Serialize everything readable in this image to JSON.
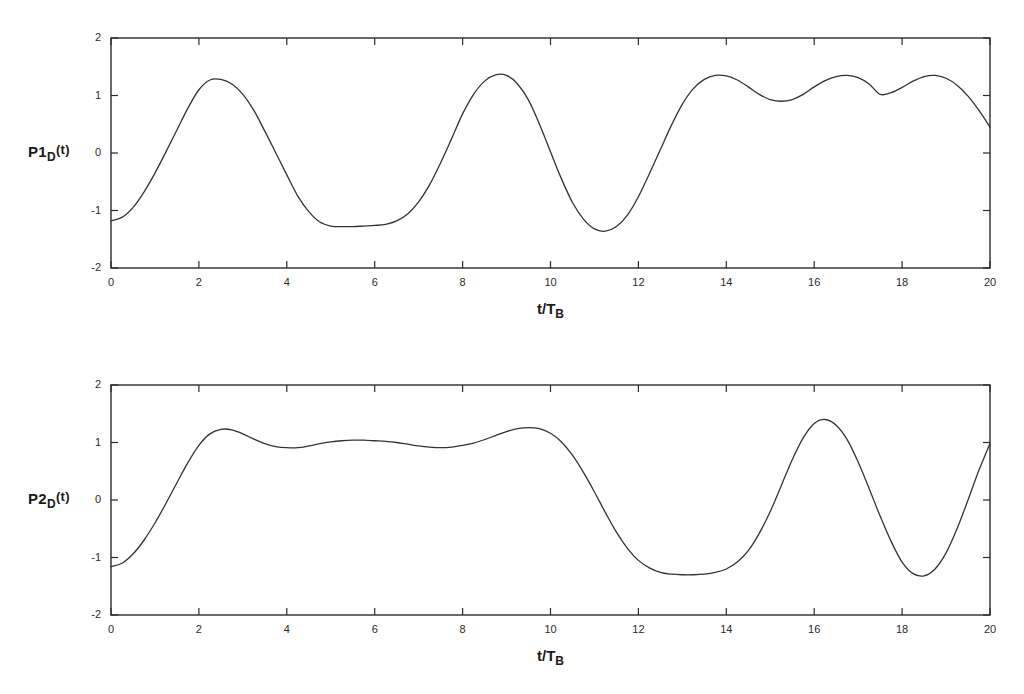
{
  "figure": {
    "background": "#ffffff",
    "line_color": "#333333",
    "axis_color": "#2b2b2b"
  },
  "chart_data": [
    {
      "type": "line",
      "id": "P1D",
      "title": "",
      "ylabel_main": "P1",
      "ylabel_sub": "D",
      "ylabel_suffix": "(t)",
      "xlabel_main": "t/T",
      "xlabel_sub": "B",
      "xlim": [
        0,
        20
      ],
      "ylim": [
        -2,
        2
      ],
      "xticks": [
        0,
        2,
        4,
        6,
        8,
        10,
        12,
        14,
        16,
        18,
        20
      ],
      "xticklabels": [
        "0",
        "2",
        "4",
        "6",
        "8",
        "10",
        "12",
        "14",
        "16",
        "18",
        "20"
      ],
      "yticks": [
        -2,
        -1,
        0,
        1,
        2
      ],
      "yticklabels": [
        "-2",
        "-1",
        "0",
        "1",
        "2"
      ],
      "grid": false,
      "legend": null,
      "x": [
        0.0,
        0.25,
        0.5,
        0.75,
        1.0,
        1.25,
        1.5,
        1.75,
        2.0,
        2.25,
        2.5,
        2.75,
        3.0,
        3.25,
        3.5,
        3.75,
        4.0,
        4.25,
        4.5,
        4.75,
        5.0,
        5.25,
        5.5,
        5.75,
        6.0,
        6.25,
        6.5,
        6.75,
        7.0,
        7.25,
        7.5,
        7.75,
        8.0,
        8.25,
        8.5,
        8.75,
        9.0,
        9.25,
        9.5,
        9.75,
        10.0,
        10.25,
        10.5,
        10.75,
        11.0,
        11.25,
        11.5,
        11.75,
        12.0,
        12.25,
        12.5,
        12.75,
        13.0,
        13.25,
        13.5,
        13.75,
        14.0,
        14.25,
        14.5,
        14.75,
        15.0,
        15.25,
        15.5,
        15.75,
        16.0,
        16.25,
        16.5,
        16.75,
        17.0,
        17.25,
        17.5,
        17.75,
        18.0,
        18.25,
        18.5,
        18.75,
        19.0,
        19.25,
        19.5,
        19.75,
        20.0
      ],
      "y": [
        -1.18,
        -1.12,
        -0.95,
        -0.68,
        -0.35,
        0.02,
        0.4,
        0.78,
        1.1,
        1.27,
        1.28,
        1.2,
        1.02,
        0.74,
        0.38,
        0.0,
        -0.38,
        -0.75,
        -1.02,
        -1.2,
        -1.27,
        -1.28,
        -1.28,
        -1.27,
        -1.26,
        -1.24,
        -1.18,
        -1.06,
        -0.85,
        -0.55,
        -0.17,
        0.25,
        0.68,
        1.02,
        1.25,
        1.36,
        1.35,
        1.2,
        0.92,
        0.5,
        0.02,
        -0.45,
        -0.86,
        -1.15,
        -1.32,
        -1.36,
        -1.28,
        -1.08,
        -0.76,
        -0.36,
        0.06,
        0.48,
        0.85,
        1.12,
        1.28,
        1.35,
        1.34,
        1.27,
        1.15,
        1.02,
        0.93,
        0.9,
        0.93,
        1.02,
        1.15,
        1.26,
        1.33,
        1.35,
        1.31,
        1.2,
        1.02,
        1.05,
        1.14,
        1.25,
        1.33,
        1.35,
        1.3,
        1.18,
        0.99,
        0.74,
        0.45
      ],
      "notes": "Oscillatory waveform with peaks near t=2 (1.28), t=8 (1.36), t=12.4 (1.34), t=15.7 (1.34) and troughs near t=4.8 (-1.28), t=10.1 (-1.36), t=18.1 (-1.30); ends rising to about 1.45 at t=20"
    },
    {
      "type": "line",
      "id": "P2D",
      "title": "",
      "ylabel_main": "P2",
      "ylabel_sub": "D",
      "ylabel_suffix": "(t)",
      "xlabel_main": "t/T",
      "xlabel_sub": "B",
      "xlim": [
        0,
        20
      ],
      "ylim": [
        -2,
        2
      ],
      "xticks": [
        0,
        2,
        4,
        6,
        8,
        10,
        12,
        14,
        16,
        18,
        20
      ],
      "xticklabels": [
        "0",
        "2",
        "4",
        "6",
        "8",
        "10",
        "12",
        "14",
        "16",
        "18",
        "20"
      ],
      "yticks": [
        -2,
        -1,
        0,
        1,
        2
      ],
      "yticklabels": [
        "-2",
        "-1",
        "0",
        "1",
        "2"
      ],
      "grid": false,
      "legend": null,
      "x": [
        0.0,
        0.25,
        0.5,
        0.75,
        1.0,
        1.25,
        1.5,
        1.75,
        2.0,
        2.25,
        2.5,
        2.75,
        3.0,
        3.25,
        3.5,
        3.75,
        4.0,
        4.25,
        4.5,
        4.75,
        5.0,
        5.25,
        5.5,
        5.75,
        6.0,
        6.25,
        6.5,
        6.75,
        7.0,
        7.25,
        7.5,
        7.75,
        8.0,
        8.25,
        8.5,
        8.75,
        9.0,
        9.25,
        9.5,
        9.75,
        10.0,
        10.25,
        10.5,
        10.75,
        11.0,
        11.25,
        11.5,
        11.75,
        12.0,
        12.25,
        12.5,
        12.75,
        13.0,
        13.25,
        13.5,
        13.75,
        14.0,
        14.25,
        14.5,
        14.75,
        15.0,
        15.25,
        15.5,
        15.75,
        16.0,
        16.25,
        16.5,
        16.75,
        17.0,
        17.25,
        17.5,
        17.75,
        18.0,
        18.25,
        18.5,
        18.75,
        19.0,
        19.25,
        19.5,
        19.75,
        20.0
      ],
      "y": [
        -1.16,
        -1.1,
        -0.94,
        -0.7,
        -0.4,
        -0.06,
        0.3,
        0.65,
        0.95,
        1.15,
        1.23,
        1.22,
        1.15,
        1.06,
        0.98,
        0.93,
        0.91,
        0.91,
        0.94,
        0.98,
        1.01,
        1.03,
        1.04,
        1.04,
        1.03,
        1.02,
        1.0,
        0.97,
        0.94,
        0.92,
        0.91,
        0.92,
        0.95,
        0.99,
        1.05,
        1.12,
        1.19,
        1.24,
        1.26,
        1.24,
        1.16,
        1.01,
        0.78,
        0.48,
        0.14,
        -0.22,
        -0.56,
        -0.84,
        -1.05,
        -1.18,
        -1.26,
        -1.29,
        -1.3,
        -1.3,
        -1.29,
        -1.26,
        -1.2,
        -1.08,
        -0.88,
        -0.58,
        -0.2,
        0.25,
        0.7,
        1.08,
        1.33,
        1.4,
        1.3,
        1.05,
        0.66,
        0.2,
        -0.28,
        -0.72,
        -1.08,
        -1.28,
        -1.32,
        -1.2,
        -0.92,
        -0.5,
        0.0,
        0.52,
        0.98
      ],
      "notes": "Rises from -1.16 at t=0 to a plateau near 1.0 with small ripples between t=2.5 and t=9.5, then drops to a broad trough near -1.30 around t=13, rises to a peak of 1.40 at t=16, falls to -1.32 at t=18.1 and ends rising to about 1.10 at t=20"
    }
  ]
}
